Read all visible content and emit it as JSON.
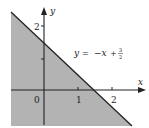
{
  "diagram": {
    "type": "inequality-half-plane",
    "equation_label": {
      "lhs": "y",
      "eq": "=",
      "rhs_term": "−x",
      "plus": "+",
      "frac_num": "3",
      "frac_den": "2"
    },
    "axes": {
      "x_label": "x",
      "y_label": "y",
      "x_ticks": [
        "0",
        "1",
        "2"
      ],
      "y_ticks": [
        "2"
      ]
    },
    "line": {
      "slope": -1,
      "intercept": 1.5
    },
    "shaded_region": "below line",
    "colors": {
      "shade": "#b3b3b3",
      "line": "#222222",
      "axis": "#222222"
    }
  }
}
